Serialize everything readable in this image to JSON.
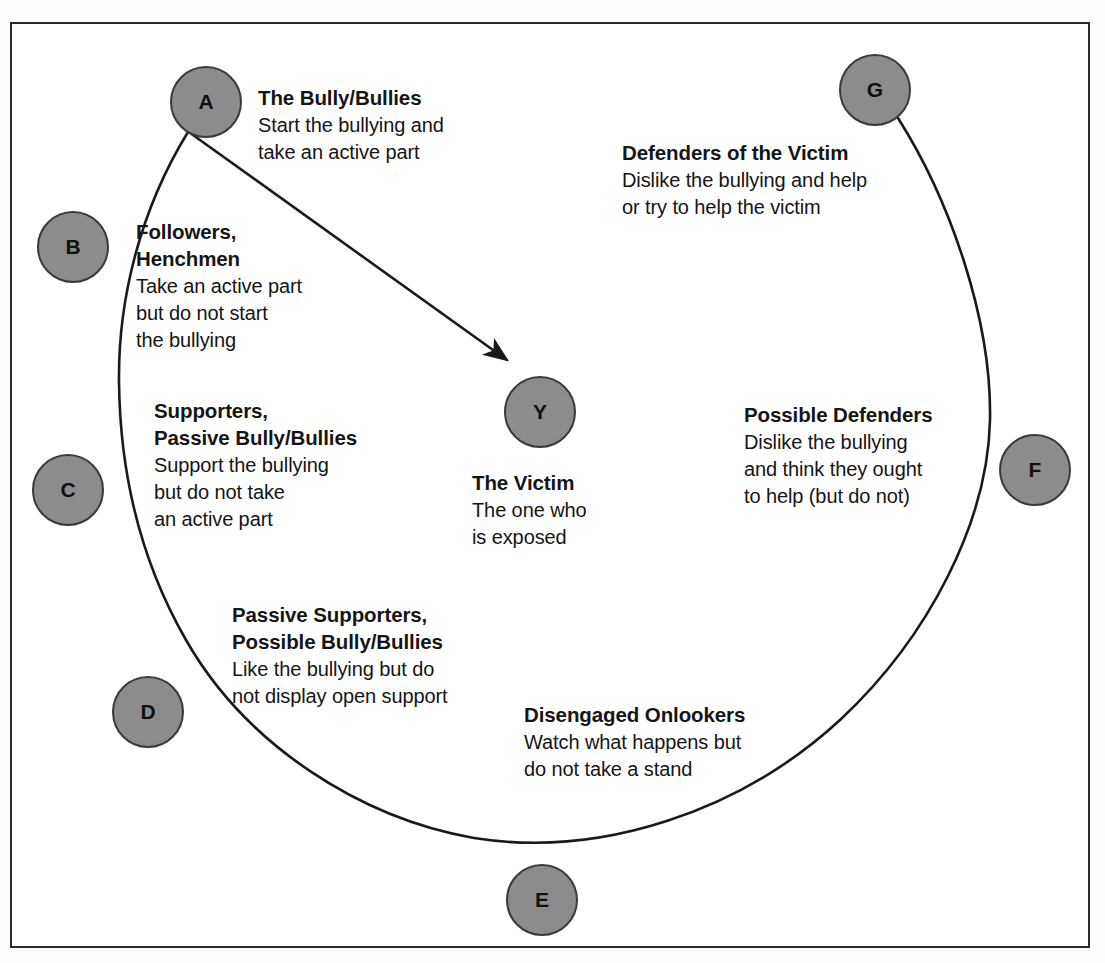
{
  "diagram": {
    "frame_color": "#2b2b2b",
    "node_fill": "#8c8c8c",
    "node_stroke": "#3a3a3a",
    "arc_color": "#1a1a1a",
    "arrow_color": "#1a1a1a",
    "nodes": [
      {
        "id": "A",
        "letter": "A",
        "title": "The Bully/Bullies",
        "desc_lines": [
          "Start the bullying and",
          "take an active part"
        ]
      },
      {
        "id": "B",
        "letter": "B",
        "title_lines": [
          "Followers,",
          "Henchmen"
        ],
        "desc_lines": [
          "Take an active part",
          "but do not start",
          "the bullying"
        ]
      },
      {
        "id": "C",
        "letter": "C",
        "title_lines": [
          "Supporters,",
          "Passive Bully/Bullies"
        ],
        "desc_lines": [
          "Support the bullying",
          "but do not take",
          "an active part"
        ]
      },
      {
        "id": "D",
        "letter": "D",
        "title_lines": [
          "Passive Supporters,",
          "Possible Bully/Bullies"
        ],
        "desc_lines": [
          "Like the bullying but do",
          "not display open support"
        ]
      },
      {
        "id": "E",
        "letter": "E",
        "title": "Disengaged Onlookers",
        "desc_lines": [
          "Watch what happens but",
          "do not take a stand"
        ]
      },
      {
        "id": "F",
        "letter": "F",
        "title": "Possible Defenders",
        "desc_lines": [
          "Dislike the bullying",
          "and think they ought",
          "to help (but do not)"
        ]
      },
      {
        "id": "G",
        "letter": "G",
        "title": "Defenders of the Victim",
        "desc_lines": [
          "Dislike the bullying and help",
          "or try to help the victim"
        ]
      },
      {
        "id": "Y",
        "letter": "Y",
        "title": "The Victim",
        "desc_lines": [
          "The one who",
          "is exposed"
        ]
      }
    ]
  }
}
